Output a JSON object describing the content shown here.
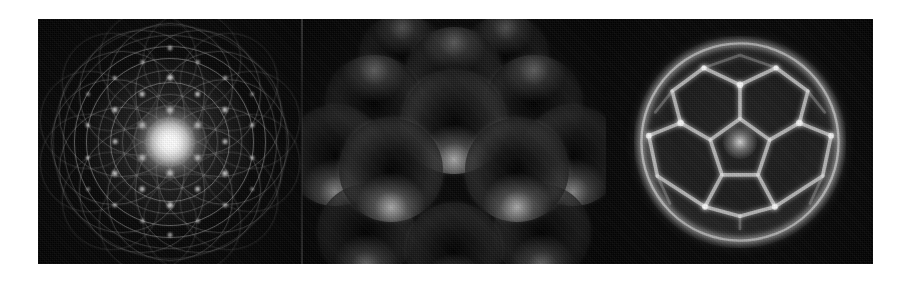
{
  "figure": {
    "kind": "three-panel-grayscale-scientific-figure",
    "background_color": "#ffffff",
    "panel_background_color": "#060606",
    "highlight_color": "#ffffff",
    "strip": {
      "left": 38,
      "top": 19,
      "width": 835,
      "height": 245
    },
    "panel_count": "3",
    "panels": [
      {
        "id": "panel-diffraction",
        "name": "diffraction-interference-pattern",
        "position": "left",
        "description": "Concentric and overlapping circle families forming a rosette moire, with bright point spots on a hexagonal lattice and an intense white core at the center.",
        "rings": [
          {
            "d": 232,
            "style": "faint"
          },
          {
            "d": 212,
            "style": "soft"
          },
          {
            "d": 190,
            "style": "normal"
          },
          {
            "d": 166,
            "style": "normal"
          },
          {
            "d": 142,
            "style": "soft"
          },
          {
            "d": 118,
            "style": "normal"
          },
          {
            "d": 94,
            "style": "soft"
          },
          {
            "d": 70,
            "style": "faint"
          },
          {
            "d": 46,
            "style": "faint"
          }
        ],
        "orbit_circles": {
          "count": "12",
          "orbit_radius": 56,
          "circle_diameter": 124,
          "style": "soft"
        },
        "orbit_circles_outer": {
          "count": "12",
          "orbit_radius": 84,
          "circle_diameter": 96,
          "style": "faint"
        },
        "core": {
          "diameter": 74,
          "brightness": "maximum"
        },
        "halo": {
          "diameter": 168
        },
        "spots": [
          {
            "x": 50.0,
            "y": 50.0,
            "d": 9.0,
            "i": 1.0
          },
          {
            "x": 50.0,
            "y": 36.5,
            "d": 5.2,
            "i": 0.92
          },
          {
            "x": 50.0,
            "y": 63.5,
            "d": 5.2,
            "i": 0.92
          },
          {
            "x": 38.3,
            "y": 43.2,
            "d": 5.0,
            "i": 0.88
          },
          {
            "x": 61.7,
            "y": 43.2,
            "d": 5.0,
            "i": 0.88
          },
          {
            "x": 38.3,
            "y": 56.8,
            "d": 5.0,
            "i": 0.88
          },
          {
            "x": 61.7,
            "y": 56.8,
            "d": 5.0,
            "i": 0.88
          },
          {
            "x": 50.0,
            "y": 23.0,
            "d": 4.6,
            "i": 0.8
          },
          {
            "x": 50.0,
            "y": 77.0,
            "d": 4.6,
            "i": 0.8
          },
          {
            "x": 26.6,
            "y": 36.5,
            "d": 4.4,
            "i": 0.74
          },
          {
            "x": 73.4,
            "y": 36.5,
            "d": 4.4,
            "i": 0.74
          },
          {
            "x": 26.6,
            "y": 63.5,
            "d": 4.4,
            "i": 0.74
          },
          {
            "x": 73.4,
            "y": 63.5,
            "d": 4.4,
            "i": 0.74
          },
          {
            "x": 38.3,
            "y": 29.8,
            "d": 4.2,
            "i": 0.7
          },
          {
            "x": 61.7,
            "y": 29.8,
            "d": 4.2,
            "i": 0.7
          },
          {
            "x": 38.3,
            "y": 70.2,
            "d": 4.2,
            "i": 0.7
          },
          {
            "x": 61.7,
            "y": 70.2,
            "d": 4.2,
            "i": 0.7
          },
          {
            "x": 26.6,
            "y": 50.0,
            "d": 4.2,
            "i": 0.66
          },
          {
            "x": 73.4,
            "y": 50.0,
            "d": 4.2,
            "i": 0.66
          },
          {
            "x": 50.0,
            "y": 10.5,
            "d": 3.8,
            "i": 0.62
          },
          {
            "x": 50.0,
            "y": 89.5,
            "d": 3.8,
            "i": 0.62
          },
          {
            "x": 15.2,
            "y": 43.2,
            "d": 3.6,
            "i": 0.52
          },
          {
            "x": 84.8,
            "y": 43.2,
            "d": 3.6,
            "i": 0.52
          },
          {
            "x": 15.2,
            "y": 56.8,
            "d": 3.6,
            "i": 0.52
          },
          {
            "x": 84.8,
            "y": 56.8,
            "d": 3.6,
            "i": 0.52
          },
          {
            "x": 26.6,
            "y": 23.0,
            "d": 3.6,
            "i": 0.5
          },
          {
            "x": 73.4,
            "y": 23.0,
            "d": 3.6,
            "i": 0.5
          },
          {
            "x": 26.6,
            "y": 77.0,
            "d": 3.6,
            "i": 0.5
          },
          {
            "x": 73.4,
            "y": 77.0,
            "d": 3.6,
            "i": 0.5
          },
          {
            "x": 38.3,
            "y": 16.4,
            "d": 3.4,
            "i": 0.46
          },
          {
            "x": 61.7,
            "y": 16.4,
            "d": 3.4,
            "i": 0.46
          },
          {
            "x": 38.3,
            "y": 83.6,
            "d": 3.4,
            "i": 0.46
          },
          {
            "x": 61.7,
            "y": 83.6,
            "d": 3.4,
            "i": 0.46
          },
          {
            "x": 15.2,
            "y": 29.8,
            "d": 3.2,
            "i": 0.4
          },
          {
            "x": 84.8,
            "y": 29.8,
            "d": 3.2,
            "i": 0.4
          },
          {
            "x": 15.2,
            "y": 70.2,
            "d": 3.2,
            "i": 0.4
          },
          {
            "x": 84.8,
            "y": 70.2,
            "d": 3.2,
            "i": 0.4
          }
        ]
      },
      {
        "id": "panel-cluster",
        "name": "close-packed-sphere-cluster",
        "position": "center",
        "description": "Thirteen overlapping rim-lit spheres in a close-packed cuboctahedral arrangement, bright crescent highlights along the lower limbs, dark matte interiors.",
        "sphere_count": "13",
        "spheres": [
          {
            "x": 21,
            "y": 34,
            "d": 96,
            "layer": "back",
            "rim": "top"
          },
          {
            "x": 79,
            "y": 34,
            "d": 96,
            "layer": "back",
            "rim": "top"
          },
          {
            "x": 50,
            "y": 22,
            "d": 96,
            "layer": "back",
            "rim": "top"
          },
          {
            "x": 7,
            "y": 56,
            "d": 100,
            "layer": "mid",
            "rim": "bottom"
          },
          {
            "x": 93,
            "y": 56,
            "d": 100,
            "layer": "mid",
            "rim": "bottom"
          },
          {
            "x": 50,
            "y": 42,
            "d": 104,
            "layer": "front",
            "rim": "bottom"
          },
          {
            "x": 27,
            "y": 62,
            "d": 104,
            "layer": "front",
            "rim": "bottom"
          },
          {
            "x": 73,
            "y": 62,
            "d": 104,
            "layer": "front",
            "rim": "bottom"
          },
          {
            "x": 18,
            "y": 88,
            "d": 96,
            "layer": "mid",
            "rim": "bottom"
          },
          {
            "x": 50,
            "y": 96,
            "d": 96,
            "layer": "mid",
            "rim": "bottom"
          },
          {
            "x": 82,
            "y": 88,
            "d": 96,
            "layer": "mid",
            "rim": "bottom"
          },
          {
            "x": 31,
            "y": 14,
            "d": 84,
            "layer": "back",
            "rim": "top"
          },
          {
            "x": 69,
            "y": 14,
            "d": 84,
            "layer": "back",
            "rim": "top"
          }
        ]
      },
      {
        "id": "panel-cage",
        "name": "polyhedral-cage-structure",
        "position": "right",
        "description": "A near-spherical glowing polyhedral cage — pentagonal and triangular faces outlined by luminous edges, with a bright node at the center and a bright limb ring.",
        "face_types": [
          "pentagon",
          "triangle",
          "quadrilateral"
        ],
        "center_node": "bright",
        "limb": "bright-ring"
      }
    ]
  }
}
